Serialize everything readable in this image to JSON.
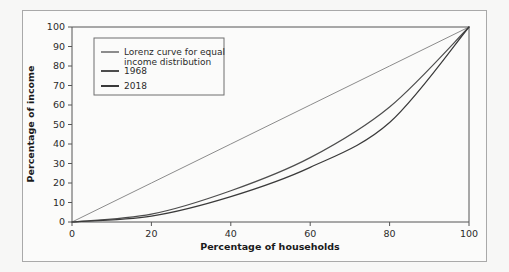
{
  "chart_data": {
    "type": "line",
    "title": "",
    "xlabel": "Percentage of households",
    "ylabel": "Percentage of income",
    "xlim": [
      0,
      100
    ],
    "ylim": [
      0,
      100
    ],
    "xticks": [
      0,
      20,
      40,
      60,
      80,
      100
    ],
    "yticks": [
      0,
      10,
      20,
      30,
      40,
      50,
      60,
      70,
      80,
      90,
      100
    ],
    "grid": false,
    "legend_position": "upper left",
    "x": [
      0,
      20,
      40,
      60,
      80,
      100
    ],
    "series": [
      {
        "name": "Lorenz curve for equal income distribution",
        "color": "#8c8c8c",
        "values": [
          0,
          20,
          40,
          60,
          80,
          100
        ]
      },
      {
        "name": "1968",
        "color": "#4d4d4d",
        "values": [
          0,
          4,
          16,
          33,
          59,
          100
        ]
      },
      {
        "name": "2018",
        "color": "#3a3a3a",
        "values": [
          0,
          3,
          13,
          28,
          51,
          100
        ]
      }
    ]
  },
  "axes": {
    "x_title": "Percentage of households",
    "y_title": "Percentage of income",
    "x_tick_labels": [
      "0",
      "20",
      "40",
      "60",
      "80",
      "100"
    ],
    "y_tick_labels": [
      "0",
      "10",
      "20",
      "30",
      "40",
      "50",
      "60",
      "70",
      "80",
      "90",
      "100"
    ]
  },
  "legend": {
    "entries": [
      {
        "label_line1": "Lorenz curve for equal",
        "label_line2": "income distribution",
        "color": "#8c8c8c"
      },
      {
        "label_line1": "1968",
        "label_line2": "",
        "color": "#4d4d4d"
      },
      {
        "label_line1": "2018",
        "label_line2": "",
        "color": "#3a3a3a"
      }
    ]
  },
  "style": {
    "page_background": "#f7f7f6",
    "figure_background": "#fbfbfa",
    "frame_color": "#a9a9a9",
    "axis_color": "#555555",
    "text_color": "#2b2b2b"
  }
}
